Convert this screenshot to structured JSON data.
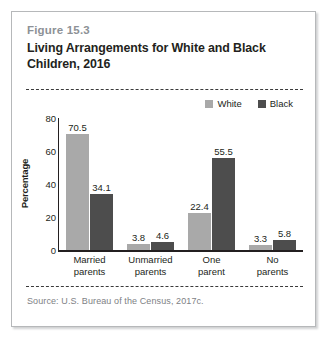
{
  "figure": {
    "number": "Figure 15.3",
    "title": "Living Arrangements for White and Black Children, 2016",
    "source": "Source: U.S. Bureau of the Census, 2017c."
  },
  "colors": {
    "white_series": "#a9a9a9",
    "black_series": "#4d4d4d",
    "axis": "#231f20",
    "fig_number": "#8d9196",
    "source_text": "#7e8185",
    "card_border": "#b6b8ba"
  },
  "chart_data": {
    "type": "bar",
    "title": "Living Arrangements for White and Black Children, 2016",
    "xlabel": "",
    "ylabel": "Percentage",
    "ylim": [
      0,
      80
    ],
    "yticks": [
      0,
      20,
      40,
      60,
      80
    ],
    "ytick_labels": [
      "0",
      "20",
      "40",
      "60",
      "80"
    ],
    "grid": false,
    "legend_position": "top-right",
    "categories": [
      "Married parents",
      "Unmarried parents",
      "One parent",
      "No parents"
    ],
    "category_lines": [
      [
        "Married",
        "parents"
      ],
      [
        "Unmarried",
        "parents"
      ],
      [
        "One",
        "parent"
      ],
      [
        "No",
        "parents"
      ]
    ],
    "series": [
      {
        "name": "White",
        "color": "#a9a9a9",
        "values": [
          70.5,
          3.8,
          22.4,
          3.3
        ],
        "labels": [
          "70.5",
          "3.8",
          "22.4",
          "3.3"
        ]
      },
      {
        "name": "Black",
        "color": "#4d4d4d",
        "values": [
          34.1,
          4.6,
          55.5,
          5.8
        ],
        "labels": [
          "34.1",
          "4.6",
          "55.5",
          "5.8"
        ]
      }
    ]
  }
}
